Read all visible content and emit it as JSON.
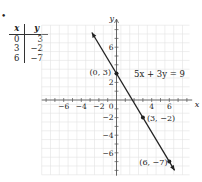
{
  "bullet": "•",
  "table": {
    "headers": [
      "x",
      "y"
    ],
    "rows": [
      [
        "0",
        "3"
      ],
      [
        "3",
        "−2"
      ],
      [
        "6",
        "−7"
      ]
    ]
  },
  "colors": {
    "grid": "#e2e2e2",
    "axis": "#555555",
    "line": "#222222",
    "text": "#222222"
  },
  "chart_data": {
    "type": "line",
    "title": "",
    "equation": "5x + 3y = 9",
    "xlabel": "x",
    "ylabel": "y",
    "xlim": [
      -8,
      8
    ],
    "ylim": [
      -8,
      8
    ],
    "grid": true,
    "x_ticks": [
      -6,
      -4,
      -2,
      4,
      6
    ],
    "x_tick_labels": [
      "−6",
      "−4",
      "−2",
      "4",
      "6"
    ],
    "y_ticks": [
      6,
      2,
      -2,
      -4,
      -6
    ],
    "y_tick_labels": [
      "6",
      "2",
      "−2",
      "−4",
      "−6"
    ],
    "origin_label": "0",
    "series": [
      {
        "name": "5x + 3y = 9",
        "x": [
          -2.8,
          6.6
        ],
        "y": [
          7.67,
          -8.0
        ]
      }
    ],
    "points": [
      {
        "x": 0,
        "y": 3,
        "label": "(0, 3)"
      },
      {
        "x": 3,
        "y": -2,
        "label": "(3, −2)"
      },
      {
        "x": 6,
        "y": -7,
        "label": "(6, −7)"
      }
    ]
  }
}
